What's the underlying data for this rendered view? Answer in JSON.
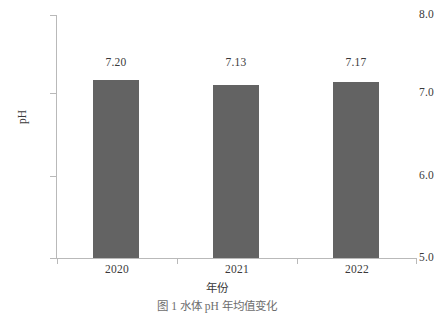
{
  "chart_data": {
    "type": "bar",
    "title": "",
    "categories": [
      "2020",
      "2021",
      "2022"
    ],
    "values": [
      7.2,
      7.13,
      7.17
    ],
    "data_labels": [
      "7.20",
      "7.13",
      "7.17"
    ],
    "xlabel": "年份",
    "ylabel": "pH",
    "ylim": [
      5.0,
      8.0
    ],
    "ytick_labels": [
      "5.0",
      "6.0",
      "7.0",
      "8.0"
    ],
    "ytick_values": [
      5.0,
      6.0,
      7.0,
      8.0
    ],
    "xtick_labels": [
      "2020",
      "2021",
      "2022"
    ],
    "grid": false,
    "legend": null,
    "bar_color": "#636363",
    "axis_color": "#b9b9b9",
    "text_color": "#3a3a3a"
  },
  "caption": {
    "text": "图 1   水体 pH 年均值变化"
  }
}
